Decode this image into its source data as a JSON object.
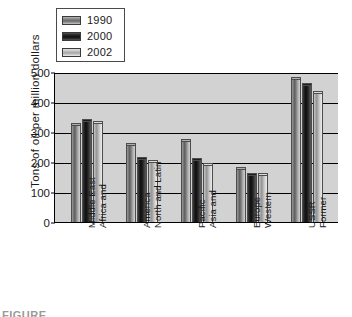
{
  "chart_data": {
    "type": "bar",
    "title": "",
    "xlabel": "",
    "ylabel": "Tons of oil per million dollars",
    "ylim": [
      0,
      500
    ],
    "yticks": [
      0,
      100,
      200,
      300,
      400,
      500
    ],
    "grid": true,
    "legend_position": "top-left",
    "categories": [
      "Africa and\nMiddle East",
      "North and Latin\nAmerica",
      "Asia and\nPacific",
      "Western\nEurope",
      "Former\nUSSR"
    ],
    "category_lines": [
      [
        "Africa and",
        "Middle East"
      ],
      [
        "North and Latin",
        "America"
      ],
      [
        "Asia and",
        "Pacific"
      ],
      [
        "Western",
        "Europe"
      ],
      [
        "Former",
        "USSR"
      ]
    ],
    "series": [
      {
        "name": "1990",
        "color": "#6a6a6a",
        "values": [
          330,
          265,
          278,
          183,
          482
        ]
      },
      {
        "name": "2000",
        "color": "#111111",
        "values": [
          345,
          218,
          212,
          165,
          462
        ]
      },
      {
        "name": "2002",
        "color": "#a6a6a6",
        "values": [
          338,
          208,
          198,
          162,
          437
        ]
      }
    ]
  },
  "legend": {
    "items": [
      {
        "label": "1990",
        "swatch": "swatch-1990-icon"
      },
      {
        "label": "2000",
        "swatch": "swatch-2000-icon"
      },
      {
        "label": "2002",
        "swatch": "swatch-2002-icon"
      }
    ]
  },
  "axes": {
    "y_title": "Tons of oil per million dollars",
    "y_ticks": [
      "500",
      "400",
      "300",
      "200",
      "100",
      "0"
    ]
  },
  "caption": {
    "text": "FIGURE"
  },
  "colors": {
    "plot_background": "#d2d2d2",
    "axis": "#000000",
    "text": "#1a1a1a",
    "page_background": "#ffffff"
  }
}
